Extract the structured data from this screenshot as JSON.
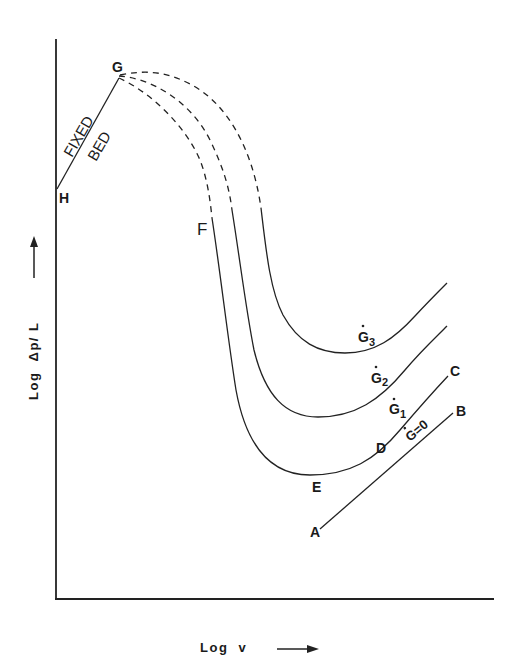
{
  "figure": {
    "y_axis_label": "Log  Δp/ L",
    "x_axis_label": "Log  v",
    "points": {
      "H": "H",
      "G": "G",
      "F": "F",
      "E": "E",
      "D": "D",
      "C": "C",
      "B": "B",
      "A": "A"
    },
    "fixed_bed_label_1": "FIXED",
    "fixed_bed_label_2": "BED",
    "curves": [
      {
        "name": "G3",
        "label_main": "G",
        "label_sub": "3"
      },
      {
        "name": "G2",
        "label_main": "G",
        "label_sub": "2"
      },
      {
        "name": "G1",
        "label_main": "G",
        "label_sub": "1"
      },
      {
        "name": "G0",
        "label": "G=0"
      }
    ]
  },
  "colors": {
    "line": "#222222",
    "background": "#ffffff"
  }
}
